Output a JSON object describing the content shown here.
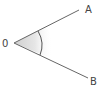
{
  "diagram": {
    "type": "angle",
    "title": "",
    "vertex": {
      "label": "0",
      "x": 14,
      "y": 43
    },
    "rays": [
      {
        "label": "A",
        "end_x": 79,
        "end_y": 10
      },
      {
        "label": "B",
        "end_x": 88,
        "end_y": 78
      }
    ],
    "angle_mark": {
      "type": "arc",
      "fill": "#d9d9d9",
      "stroke": "#555555"
    },
    "line_color": "#666666"
  }
}
